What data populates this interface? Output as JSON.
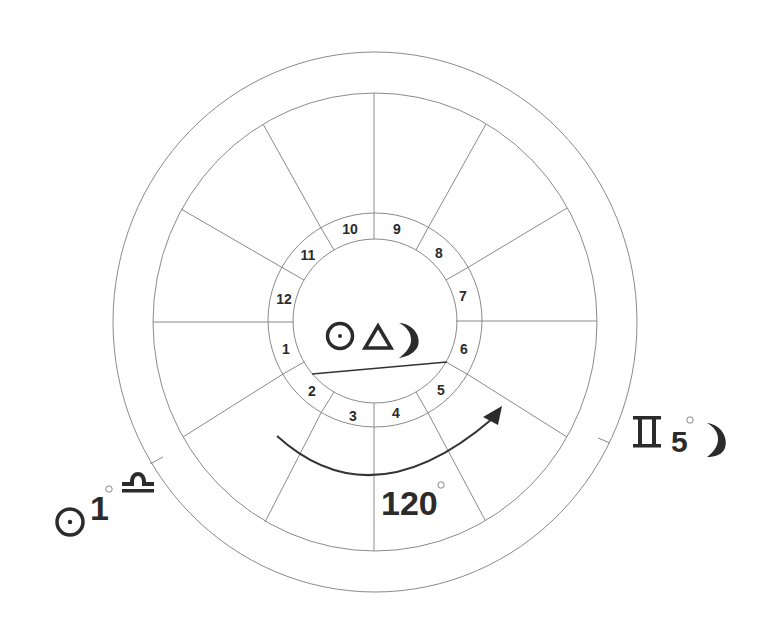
{
  "diagram": {
    "type": "astrological-house-wheel",
    "houses": [
      {
        "number": "1"
      },
      {
        "number": "2"
      },
      {
        "number": "3"
      },
      {
        "number": "4"
      },
      {
        "number": "5"
      },
      {
        "number": "6"
      },
      {
        "number": "7"
      },
      {
        "number": "8"
      },
      {
        "number": "9"
      },
      {
        "number": "10"
      },
      {
        "number": "11"
      },
      {
        "number": "12"
      }
    ],
    "center_aspect": {
      "planet_a": "sun-icon",
      "aspect": "trine-icon",
      "planet_b": "moon-icon"
    },
    "left_label": {
      "planet": "sun-icon",
      "degree": "1",
      "degree_symbol": "°",
      "sign": "libra-icon"
    },
    "right_label": {
      "sign": "gemini-icon",
      "degree": "5",
      "degree_symbol": "°",
      "planet": "moon-icon"
    },
    "arc_label": {
      "value": "120",
      "degree_symbol": "°"
    },
    "colors": {
      "lines": "#8a8a8a",
      "text": "#2b2b2b",
      "background": "#ffffff"
    }
  }
}
